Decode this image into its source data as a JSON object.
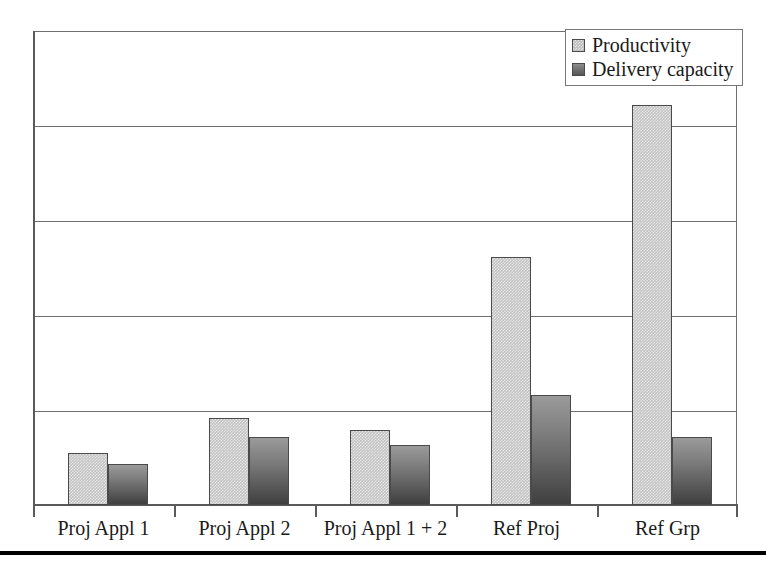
{
  "chart_data": {
    "type": "bar",
    "title": "",
    "subtitle": "",
    "xlabel": "",
    "ylabel": "",
    "categories": [
      "Proj Appl 1",
      "Proj Appl 2",
      "Proj Appl 1 + 2",
      "Ref Proj",
      "Ref Grp"
    ],
    "series": [
      {
        "name": "Productivity",
        "color": "#c3c3c3",
        "values": [
          0.55,
          0.92,
          0.79,
          2.62,
          4.22
        ]
      },
      {
        "name": "Delivery capacity",
        "color": "#6a6a6a",
        "values": [
          0.43,
          0.72,
          0.63,
          1.16,
          0.72
        ]
      }
    ],
    "ylim": [
      0,
      5
    ],
    "y_gridline_values": [
      1,
      2,
      3,
      4,
      5
    ],
    "y_tick_labels": [],
    "grid": true,
    "grid_axis": "y",
    "legend_position": "top-right"
  },
  "legend": {
    "entries": [
      {
        "label": "Productivity",
        "swatch": "light-gray-square"
      },
      {
        "label": "Delivery capacity",
        "swatch": "dark-gray-square"
      }
    ]
  },
  "axis": {
    "category_labels": [
      "Proj Appl 1",
      "Proj Appl 2",
      "Proj Appl 1 + 2",
      "Ref Proj",
      "Ref Grp"
    ]
  },
  "colors": {
    "productivity_fill": "#c3c3c3",
    "delivery_fill": "#6a6a6a",
    "bar_outline": "#4a4a4a",
    "gridline": "#6e6e6e",
    "axis": "#5a5a5a",
    "plot_background": "#ffffff",
    "footer_rule": "#000000",
    "text": "#1a1a1a"
  }
}
